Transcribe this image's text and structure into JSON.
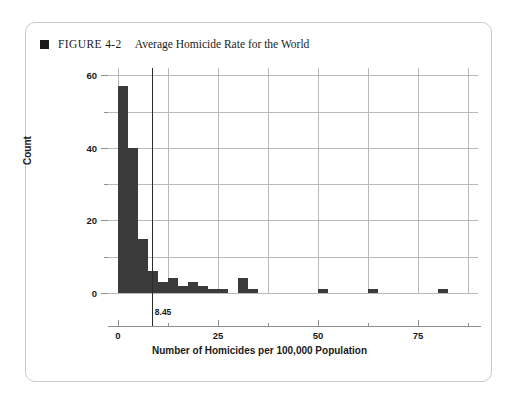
{
  "figure": {
    "marker_icon": "filled-square-icon",
    "number_label": "FIGURE 4-2",
    "title": "Average Homicide Rate for the World"
  },
  "colors": {
    "bar": "#3b3b3b",
    "grid": "#b9b9b9",
    "axis": "#8d8d8d",
    "text": "#1a1a1a",
    "border": "#c9c9c9",
    "refline": "#2b2b2b"
  },
  "chart_data": {
    "type": "bar",
    "subtype": "histogram",
    "title": "Average Homicide Rate for the World",
    "xlabel": "Number of Homicides per 100,000 Population",
    "ylabel": "Count",
    "xlim": [
      -2.5,
      90
    ],
    "ylim": [
      0,
      62
    ],
    "bin_width": 2.5,
    "grid": "both",
    "legend": "none",
    "xticks": [
      0,
      25,
      50,
      75
    ],
    "xtick_labels": [
      "0",
      "25",
      "50",
      "75"
    ],
    "xticks_minor": [
      12.5,
      37.5,
      62.5,
      87.5
    ],
    "yticks": [
      0,
      20,
      40,
      60
    ],
    "ytick_labels": [
      "0",
      "20",
      "40",
      "60"
    ],
    "yticks_minor": [
      10,
      30,
      50
    ],
    "bin_starts": [
      0,
      2.5,
      5,
      7.5,
      10,
      12.5,
      15,
      17.5,
      20,
      22.5,
      25,
      27.5,
      30,
      32.5,
      35,
      37.5,
      40,
      42.5,
      45,
      47.5,
      50,
      52.5,
      55,
      57.5,
      60,
      62.5,
      65,
      67.5,
      70,
      72.5,
      75,
      77.5,
      80,
      82.5,
      85
    ],
    "values": [
      57,
      40,
      15,
      6,
      3,
      4,
      2,
      3,
      2,
      1,
      1,
      0,
      4,
      1,
      0,
      0,
      0,
      0,
      0,
      0,
      1,
      0,
      0,
      0,
      0,
      1,
      0,
      0,
      0,
      0,
      0,
      0,
      1,
      0,
      0
    ],
    "annotations": [
      {
        "type": "vertical-reference-line",
        "x": 8.45,
        "label": "8.45",
        "description": "world average homicide rate"
      }
    ]
  }
}
